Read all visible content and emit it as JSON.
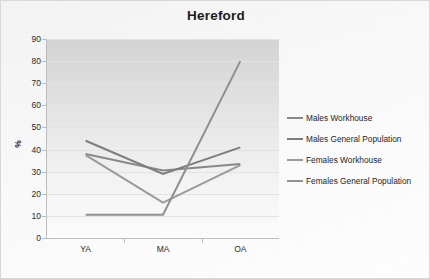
{
  "chart_data": {
    "type": "line",
    "title": "Hereford",
    "xlabel": "",
    "ylabel": "%",
    "categories": [
      "YA",
      "MA",
      "OA"
    ],
    "ylim": [
      0,
      90
    ],
    "ytick_step": 10,
    "yticks": [
      90,
      80,
      70,
      60,
      50,
      40,
      30,
      20,
      10,
      0
    ],
    "grid": true,
    "legend_position": "right",
    "series": [
      {
        "name": "Males Workhouse",
        "values": [
          38.0,
          30.5,
          33.5
        ],
        "color": "#888888"
      },
      {
        "name": "Males General Population",
        "values": [
          44.0,
          29.0,
          41.0
        ],
        "color": "#7d7d7d"
      },
      {
        "name": "Females Workhouse",
        "values": [
          37.5,
          16.0,
          33.0
        ],
        "color": "#9a9a9a"
      },
      {
        "name": "Females General Population",
        "values": [
          10.5,
          10.5,
          80.0
        ],
        "color": "#8f8f8f"
      }
    ]
  },
  "legend": {
    "items": [
      {
        "label": "Males Workhouse"
      },
      {
        "label": "Males General Population"
      },
      {
        "label": "Females Workhouse"
      },
      {
        "label": "Females General Population"
      }
    ]
  },
  "colors": {
    "plot_background_top": "#d3d3d3",
    "plot_background_bottom": "#fbfbfb",
    "frame_background": "#f6f6f6",
    "axis": "#bdbdbd",
    "gridline": "#e2e2e2",
    "text": "#1c1c1c"
  }
}
